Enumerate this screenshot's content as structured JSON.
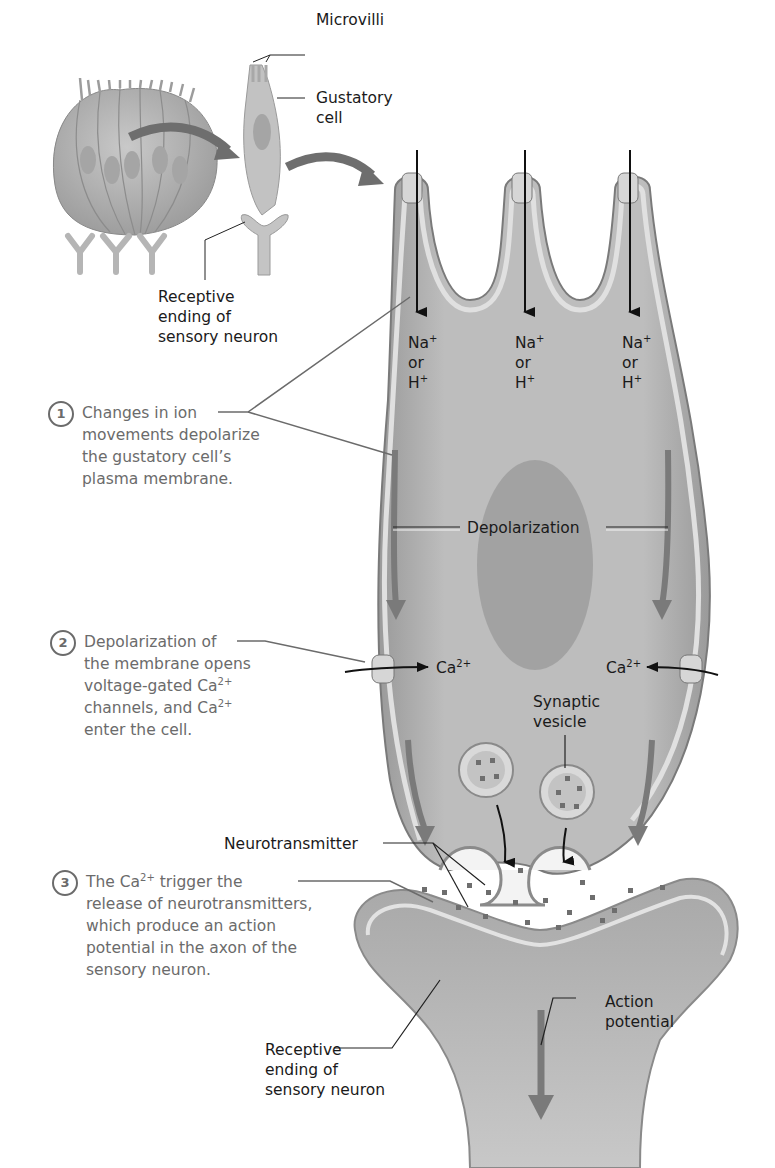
{
  "overview": {
    "microvilli_label": "Microvilli",
    "gustatory_cell_label": "Gustatory cell",
    "gustatory_cell_line1": "Gustatory",
    "gustatory_cell_line2": "cell",
    "receptive_ending_top": {
      "line1": "Receptive",
      "line2": "ending of",
      "line3": "sensory neuron"
    }
  },
  "ions": [
    {
      "species": "Na",
      "charge": "+",
      "or": "or",
      "alt_species": "H",
      "alt_charge": "+"
    },
    {
      "species": "Na",
      "charge": "+",
      "or": "or",
      "alt_species": "H",
      "alt_charge": "+"
    },
    {
      "species": "Na",
      "charge": "+",
      "or": "or",
      "alt_species": "H",
      "alt_charge": "+"
    }
  ],
  "labels": {
    "depolarization": "Depolarization",
    "calcium_left": {
      "base": "Ca",
      "charge": "2+"
    },
    "calcium_right": {
      "base": "Ca",
      "charge": "2+"
    },
    "synaptic_vesicle_line1": "Synaptic",
    "synaptic_vesicle_line2": "vesicle",
    "neurotransmitter": "Neurotransmitter",
    "action_potential_line1": "Action",
    "action_potential_line2": "potential",
    "receptive_ending_bottom": {
      "line1": "Receptive",
      "line2": "ending of",
      "line3": "sensory neuron"
    }
  },
  "steps": [
    {
      "number": "1",
      "lines": [
        "Changes in ion",
        "movements depolarize",
        "the gustatory cell’s",
        "plasma membrane."
      ]
    },
    {
      "number": "2",
      "line1": "Depolarization of",
      "line2": "the membrane opens",
      "line3_pre": "voltage-gated Ca",
      "line3_sup": "2+",
      "line4_pre": "channels, and Ca",
      "line4_sup": "2+",
      "line5": "enter the cell."
    },
    {
      "number": "3",
      "line1_pre": "The Ca",
      "line1_sup": "2+",
      "line1_post": " trigger the",
      "line2": "release of neurotransmitters,",
      "line3": "which produce an action",
      "line4": "potential in the axon of the",
      "line5": "sensory neuron."
    }
  ],
  "colors": {
    "cell_fill": "#b3b3b3",
    "membrane_light": "#dcdcdc",
    "membrane_dark": "#8a8a8a",
    "nucleus": "#9a9a9a",
    "arrow_gray": "#7a7a7a",
    "step_text": "#6b6b6b",
    "label_text": "#1a1a1a"
  }
}
